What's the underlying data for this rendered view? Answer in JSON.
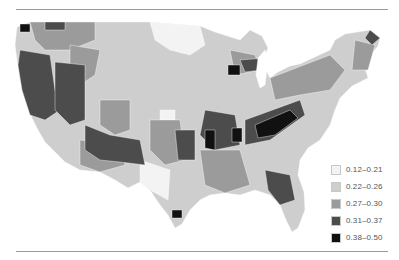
{
  "legend": {
    "items": [
      {
        "label": "0.12–0.21",
        "color": "#f3f3f3"
      },
      {
        "label": "0.22–0.26",
        "color": "#cecece"
      },
      {
        "label": "0.27–0.30",
        "color": "#9b9b9b"
      },
      {
        "label": "0.31–0.37",
        "color": "#4c4c4c"
      },
      {
        "label": "0.38–0.50",
        "color": "#111111"
      }
    ]
  },
  "map": {
    "subject": "United States county-level choropleth (contiguous US)",
    "classes": 5
  }
}
